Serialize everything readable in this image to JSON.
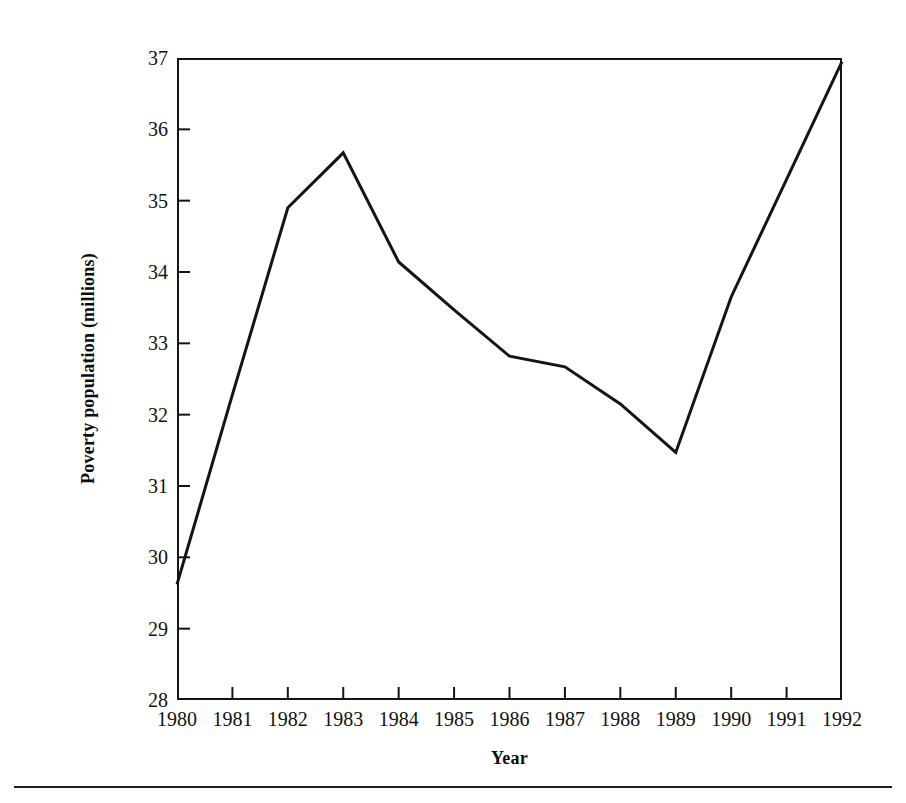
{
  "page": {
    "top_sliver_text": "· · · · · ·",
    "background_color": "#ffffff",
    "ink_color": "#141414"
  },
  "chart_data": {
    "type": "line",
    "title": "",
    "xlabel": "Year",
    "ylabel": "Poverty population (millions)",
    "categories": [
      1980,
      1981,
      1982,
      1983,
      1984,
      1985,
      1986,
      1987,
      1988,
      1989,
      1990,
      1991,
      1992
    ],
    "x_tick_labels": [
      "1980",
      "1981",
      "1982",
      "1983",
      "1984",
      "1985",
      "1986",
      "1987",
      "1988",
      "1989",
      "1990",
      "1991",
      "1992"
    ],
    "y_tick_labels": [
      "37",
      "36",
      "35",
      "34",
      "33",
      "32",
      "31",
      "30",
      "29",
      "28"
    ],
    "y_ticks": [
      37,
      36,
      35,
      34,
      33,
      32,
      31,
      30,
      29,
      28
    ],
    "values": [
      29.62,
      32.28,
      34.9,
      35.67,
      34.14,
      33.47,
      32.82,
      32.67,
      32.15,
      31.47,
      33.65,
      35.3,
      36.95
    ],
    "series": [
      {
        "name": "Poverty population",
        "values": [
          29.62,
          32.28,
          34.9,
          35.67,
          34.14,
          33.47,
          32.82,
          32.67,
          32.15,
          31.47,
          33.65,
          35.3,
          36.95
        ],
        "color": "#141414",
        "line_width": 3
      }
    ],
    "xlim": [
      1980,
      1992
    ],
    "ylim": [
      28,
      37
    ],
    "grid": false,
    "legend": false,
    "legend_position": "none",
    "markers": false,
    "annotations": []
  }
}
